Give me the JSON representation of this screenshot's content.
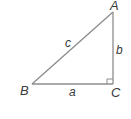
{
  "diagram": {
    "type": "right-triangle",
    "colors": {
      "stroke": "#8c8c8c",
      "text": "#3a3a3a",
      "background": "#ffffff"
    },
    "vertices": {
      "A": {
        "label": "A",
        "x": 113,
        "y": 12
      },
      "B": {
        "label": "B",
        "x": 32,
        "y": 84
      },
      "C": {
        "label": "C",
        "x": 113,
        "y": 84
      }
    },
    "sides": {
      "a": {
        "label": "a",
        "between": [
          "B",
          "C"
        ]
      },
      "b": {
        "label": "b",
        "between": [
          "A",
          "C"
        ]
      },
      "c": {
        "label": "c",
        "between": [
          "A",
          "B"
        ]
      }
    },
    "right_angle_at": "C"
  }
}
